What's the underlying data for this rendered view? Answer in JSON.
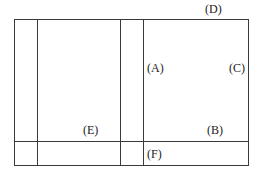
{
  "diagram": {
    "type": "grid-layout-diagram",
    "outer_box": {
      "x": 14,
      "y": 19,
      "width": 235,
      "height": 147
    },
    "vertical_lines_x": [
      37,
      120,
      143
    ],
    "horizontal_lines_y": [
      141
    ],
    "line_color": "#3a3a3a",
    "labels": [
      {
        "id": "D",
        "text": "(D)",
        "x": 205,
        "y": 3
      },
      {
        "id": "A",
        "text": "(A)",
        "x": 147,
        "y": 62
      },
      {
        "id": "C",
        "text": "(C)",
        "x": 229,
        "y": 62
      },
      {
        "id": "E",
        "text": "(E)",
        "x": 83,
        "y": 124
      },
      {
        "id": "B",
        "text": "(B)",
        "x": 207,
        "y": 124
      },
      {
        "id": "F",
        "text": "(F)",
        "x": 147,
        "y": 148
      }
    ]
  }
}
